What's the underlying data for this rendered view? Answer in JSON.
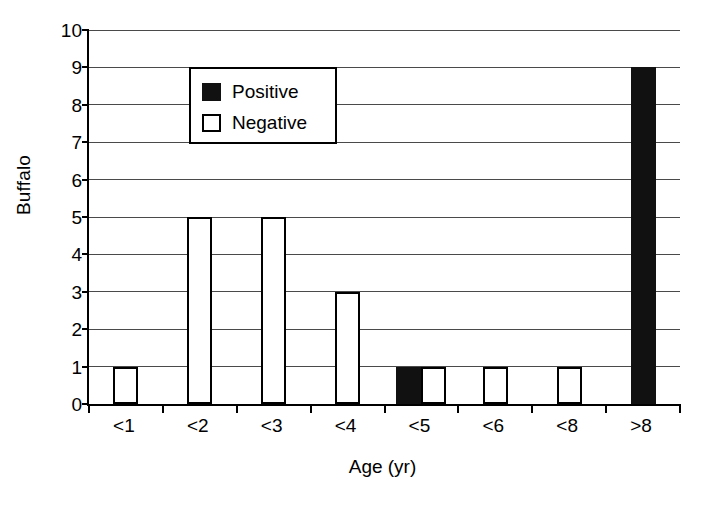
{
  "chart_data": {
    "type": "bar",
    "title": "",
    "xlabel": "Age (yr)",
    "ylabel": "Buffalo",
    "categories": [
      "<1",
      "<2",
      "<3",
      "<4",
      "<5",
      "<6",
      "<8",
      ">8"
    ],
    "series": [
      {
        "name": "Positive",
        "color": "#111111",
        "values": [
          0,
          0,
          0,
          0,
          1,
          0,
          0,
          9
        ]
      },
      {
        "name": "Negative",
        "color": "#ffffff",
        "values": [
          1,
          5,
          5,
          3,
          1,
          1,
          1,
          0
        ]
      }
    ],
    "ylim": [
      0,
      10
    ],
    "yticks": [
      0,
      1,
      2,
      3,
      4,
      5,
      6,
      7,
      8,
      9,
      10
    ],
    "ytick_labels": [
      "0",
      "1",
      "2",
      "3",
      "4",
      "5",
      "6",
      "7",
      "8",
      "9",
      "10"
    ],
    "grid": true,
    "grid_axis": "y",
    "legend_position": "upper left",
    "legend_entries": [
      {
        "label": "Positive",
        "swatch": "filled-black"
      },
      {
        "label": "Negative",
        "swatch": "outlined-white"
      }
    ]
  }
}
